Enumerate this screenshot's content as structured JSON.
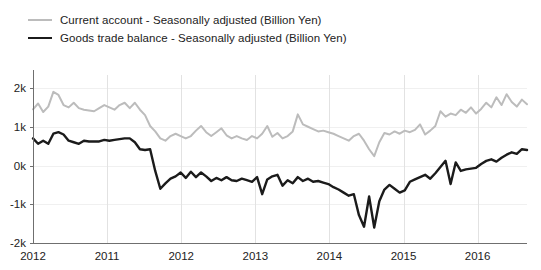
{
  "chart_data": {
    "type": "line",
    "title": "",
    "subtitle": "",
    "xlabel": "",
    "ylabel": "",
    "grid": true,
    "legend_position": "top-left",
    "ylim": [
      -2000,
      2000
    ],
    "ytick_values": [
      2000,
      1000,
      0,
      -1000,
      -2000
    ],
    "ytick_labels": [
      "2k",
      "1k",
      "0k",
      "-1k",
      "-2k"
    ],
    "xtick_labels": [
      "2012",
      "2011",
      "2012",
      "2013",
      "2014",
      "2015",
      "2016"
    ],
    "xtick_positions": [
      0,
      12,
      24,
      36,
      48,
      60,
      72
    ],
    "x_index_count": 80,
    "series": [
      {
        "name": "Current account - Seasonally adjusted (Billion Yen)",
        "color": "#bcbcbc",
        "width": 2.0,
        "values": [
          1450,
          1600,
          1380,
          1520,
          1900,
          1820,
          1560,
          1500,
          1620,
          1480,
          1440,
          1420,
          1400,
          1480,
          1560,
          1500,
          1440,
          1560,
          1620,
          1480,
          1620,
          1440,
          1300,
          1020,
          880,
          700,
          640,
          760,
          820,
          760,
          700,
          760,
          900,
          1020,
          860,
          760,
          860,
          960,
          780,
          700,
          760,
          700,
          660,
          760,
          700,
          820,
          1020,
          740,
          840,
          700,
          760,
          880,
          1320,
          1060,
          1000,
          940,
          880,
          900,
          860,
          820,
          760,
          700,
          640,
          760,
          820,
          640,
          420,
          240,
          600,
          840,
          800,
          880,
          820,
          900,
          860,
          920,
          1060,
          800,
          900,
          1020,
          1400,
          1260,
          1340,
          1300,
          1440,
          1360,
          1500,
          1340,
          1460,
          1620,
          1500,
          1760,
          1560,
          1840,
          1640,
          1520,
          1700,
          1580
        ]
      },
      {
        "name": "Goods trade balance - Seasonally adjusted (Billion Yen)",
        "color": "#1b1b1b",
        "width": 2.4,
        "values": [
          700,
          560,
          640,
          560,
          820,
          860,
          800,
          640,
          600,
          560,
          640,
          620,
          620,
          620,
          660,
          640,
          660,
          680,
          700,
          700,
          600,
          420,
          400,
          420,
          -140,
          -600,
          -460,
          -340,
          -280,
          -180,
          -320,
          -160,
          -300,
          -180,
          -280,
          -400,
          -320,
          -380,
          -300,
          -380,
          -400,
          -340,
          -380,
          -420,
          -300,
          -740,
          -360,
          -280,
          -240,
          -520,
          -380,
          -460,
          -300,
          -400,
          -340,
          -420,
          -400,
          -440,
          -480,
          -560,
          -620,
          -700,
          -780,
          -740,
          -1280,
          -1580,
          -800,
          -1600,
          -920,
          -620,
          -500,
          -600,
          -700,
          -640,
          -420,
          -360,
          -300,
          -240,
          -340,
          -200,
          -40,
          120,
          -480,
          80,
          -140,
          -100,
          -80,
          -60,
          40,
          120,
          160,
          100,
          200,
          280,
          340,
          300,
          420,
          400
        ]
      }
    ]
  },
  "legend": {
    "items": [
      {
        "label": "Current account - Seasonally adjusted (Billion Yen)",
        "color": "#bcbcbc"
      },
      {
        "label": "Goods trade balance - Seasonally adjusted (Billion Yen)",
        "color": "#1b1b1b"
      }
    ]
  },
  "colors": {
    "current_account": "#bcbcbc",
    "goods_trade_balance": "#1b1b1b",
    "axis": "#6f6f6f",
    "grid_horizontal": "#f0f0f0",
    "grid_vertical": "#e2e2e2",
    "background": "#ffffff",
    "text": "#222222"
  }
}
